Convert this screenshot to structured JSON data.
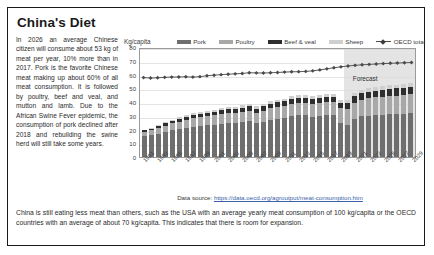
{
  "page": {
    "title": "China's Diet"
  },
  "left_text": "In 2026 an average Chinese citizen will consume about 53 kg of meat per year, 10% more than in 2017. Pork is the favorite Chinese meat making up about 60% of all meat consumption. It is followed by poultry, beef and veal, and mutton and lamb. Due to the African Swine Fever epidemic, the consumption of pork declined after 2018 and rebuilding the swine herd will still take some years.",
  "bottom_text": "China is still eating less meat than others, such as the USA with an average yearly meat consumption of 100 kg/capita or the OECD countries with an average of about 70 kg/capita. This indicates that there is room for expansion.",
  "source": {
    "label": "Data source: ",
    "url_text": "https://data.oecd.org/agroutput/meat-consumption.htm"
  },
  "chart_data": {
    "type": "bar",
    "title": "",
    "xlabel": "",
    "ylabel": "Kg/capita",
    "ylim": [
      0,
      80
    ],
    "yticks": [
      0,
      10,
      20,
      30,
      40,
      50,
      60,
      70,
      80
    ],
    "grid": true,
    "legend_position": "top",
    "stacked": true,
    "annotation": "Forecast",
    "forecast_start_year": 2020,
    "categories": [
      1991,
      1992,
      1993,
      1994,
      1995,
      1996,
      1997,
      1998,
      1999,
      2000,
      2001,
      2002,
      2003,
      2004,
      2005,
      2006,
      2007,
      2008,
      2009,
      2010,
      2011,
      2012,
      2013,
      2014,
      2015,
      2016,
      2017,
      2018,
      2019,
      2020,
      2021,
      2022,
      2023,
      2024,
      2025,
      2026,
      2027,
      2028,
      2029
    ],
    "tick_labels": [
      "1991",
      "1993",
      "1995",
      "1997",
      "1999",
      "2001",
      "2003",
      "2005",
      "2007",
      "2009",
      "2011",
      "2013",
      "2015",
      "2017",
      "2019",
      "2021",
      "2023",
      "2025",
      "2027",
      "2029"
    ],
    "series": [
      {
        "name": "Pork",
        "color": "#6e6e6e",
        "values": [
          15.5,
          16.2,
          17.0,
          18.3,
          19.4,
          20.3,
          21.2,
          22.0,
          22.6,
          23.1,
          23.5,
          24.0,
          24.5,
          24.7,
          25.2,
          25.9,
          24.4,
          25.6,
          27.0,
          27.9,
          28.4,
          29.6,
          30.2,
          30.4,
          29.4,
          30.0,
          30.6,
          30.4,
          24.4,
          23.3,
          27.6,
          29.5,
          30.1,
          30.5,
          30.8,
          31.1,
          31.3,
          31.5,
          31.7
        ]
      },
      {
        "name": "Poultry",
        "color": "#a8a8a8",
        "values": [
          3.0,
          3.4,
          3.9,
          4.6,
          5.0,
          5.5,
          5.9,
          6.1,
          6.4,
          6.6,
          6.8,
          7.1,
          7.3,
          7.3,
          7.6,
          7.9,
          7.8,
          8.1,
          8.4,
          8.6,
          8.8,
          9.1,
          9.3,
          9.1,
          9.2,
          9.4,
          9.5,
          9.7,
          10.9,
          11.6,
          12.0,
          12.3,
          12.6,
          12.8,
          13.0,
          13.2,
          13.4,
          13.6,
          13.8
        ]
      },
      {
        "name": "Beef & veal",
        "color": "#2e2e2e",
        "values": [
          0.9,
          1.1,
          1.3,
          1.5,
          1.8,
          2.0,
          2.2,
          2.4,
          2.5,
          2.6,
          2.7,
          2.8,
          2.9,
          2.9,
          3.0,
          3.1,
          3.0,
          3.1,
          3.2,
          3.3,
          3.4,
          3.5,
          3.5,
          3.5,
          3.6,
          3.7,
          3.8,
          3.9,
          4.2,
          4.4,
          4.6,
          4.7,
          4.8,
          4.9,
          5.0,
          5.1,
          5.2,
          5.3,
          5.3
        ]
      },
      {
        "name": "Sheep",
        "color": "#cfcfcf",
        "values": [
          0.6,
          0.7,
          0.8,
          0.9,
          1.0,
          1.1,
          1.2,
          1.3,
          1.4,
          1.4,
          1.5,
          1.5,
          1.6,
          1.6,
          1.7,
          1.7,
          1.7,
          1.8,
          1.8,
          1.9,
          1.9,
          2.0,
          2.0,
          2.0,
          2.0,
          2.1,
          2.1,
          2.2,
          2.3,
          2.4,
          2.4,
          2.5,
          2.5,
          2.6,
          2.6,
          2.7,
          2.7,
          2.8,
          2.8
        ]
      }
    ],
    "line_series": {
      "name": "OECD total",
      "color": "#4a4a4a",
      "marker": "diamond",
      "values": [
        58.8,
        58.5,
        58.7,
        59.0,
        59.2,
        59.3,
        59.4,
        59.2,
        59.5,
        60.2,
        60.6,
        61.0,
        61.3,
        61.6,
        61.9,
        62.4,
        62.3,
        62.2,
        62.4,
        62.6,
        62.9,
        63.1,
        63.2,
        63.4,
        63.8,
        64.5,
        65.3,
        66.1,
        66.8,
        67.4,
        67.9,
        68.3,
        68.6,
        68.9,
        69.2,
        69.4,
        69.6,
        69.8,
        70.0
      ]
    }
  }
}
